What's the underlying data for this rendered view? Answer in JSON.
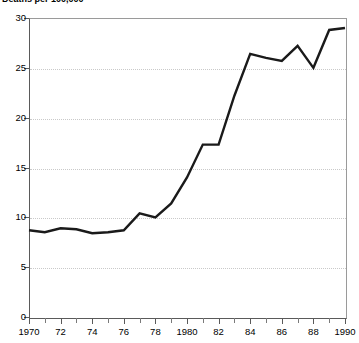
{
  "chart_data": {
    "type": "line",
    "title": "Deaths per 100,000",
    "xlabel": "",
    "ylabel": "",
    "xlim": [
      1970,
      1990
    ],
    "ylim": [
      0,
      30
    ],
    "grid": true,
    "legend": false,
    "y_ticks": [
      0,
      5,
      10,
      15,
      20,
      25,
      30
    ],
    "y_tick_labels": [
      "0",
      "5",
      "10",
      "15",
      "20",
      "25",
      "30"
    ],
    "x_ticks": [
      1970,
      1972,
      1974,
      1976,
      1978,
      1980,
      1982,
      1984,
      1986,
      1988,
      1990
    ],
    "x_tick_labels": [
      "1970",
      "72",
      "74",
      "76",
      "78",
      "1980",
      "82",
      "84",
      "86",
      "88",
      "1990"
    ],
    "x_minor_ticks": [
      1971,
      1973,
      1975,
      1977,
      1979,
      1981,
      1983,
      1985,
      1987,
      1989
    ],
    "line_color": "#1a1a1a",
    "grid_color": "#c9c9c9",
    "axis_color": "#5a5a5a",
    "x": [
      1970,
      1971,
      1972,
      1973,
      1974,
      1975,
      1976,
      1977,
      1978,
      1979,
      1980,
      1981,
      1982,
      1983,
      1984,
      1985,
      1986,
      1987,
      1988,
      1989,
      1990
    ],
    "values": [
      8.7,
      8.5,
      8.9,
      8.8,
      8.4,
      8.5,
      8.7,
      10.4,
      10.0,
      11.4,
      14.0,
      17.3,
      17.3,
      22.2,
      26.4,
      26.0,
      25.7,
      27.2,
      25.0,
      28.8,
      29.0
    ],
    "series": [
      {
        "name": "Deaths per 100,000",
        "values": [
          8.7,
          8.5,
          8.9,
          8.8,
          8.4,
          8.5,
          8.7,
          10.4,
          10.0,
          11.4,
          14.0,
          17.3,
          17.3,
          22.2,
          26.4,
          26.0,
          25.7,
          27.2,
          25.0,
          28.8,
          29.0
        ]
      }
    ]
  }
}
